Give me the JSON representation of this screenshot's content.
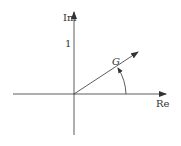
{
  "diagram": {
    "type": "complex-plane-phasor",
    "axes": {
      "imaginary_label": "Im",
      "real_label": "Re",
      "tick_label": "1"
    },
    "vector": {
      "label": "G",
      "angle_arc": true
    },
    "colors": {
      "stroke": "#333333",
      "background": "#ffffff"
    }
  }
}
